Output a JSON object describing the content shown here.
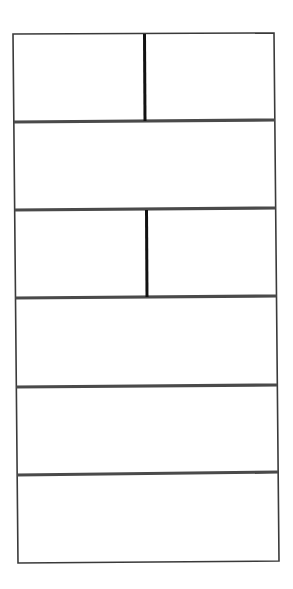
{
  "diagram": {
    "type": "panel-layout-grid",
    "colors": {
      "background": "#ffffff",
      "outer_border": "#3a3a3a",
      "row_divider": "#4a4a4a",
      "column_divider": "#111111"
    },
    "outer_box": {
      "top_left": [
        13,
        34
      ],
      "top_right": [
        274,
        33
      ],
      "bottom_right": [
        279,
        561
      ],
      "bottom_left": [
        18,
        563
      ]
    },
    "rows": [
      {
        "index": 1,
        "y_top": 34,
        "y_bottom": 121,
        "columns": 2,
        "split_x": 144
      },
      {
        "index": 2,
        "y_top": 121,
        "y_bottom": 209,
        "columns": 1
      },
      {
        "index": 3,
        "y_top": 209,
        "y_bottom": 297,
        "columns": 2,
        "split_x": 146
      },
      {
        "index": 4,
        "y_top": 297,
        "y_bottom": 386,
        "columns": 1
      },
      {
        "index": 5,
        "y_top": 386,
        "y_bottom": 474,
        "columns": 1
      },
      {
        "index": 6,
        "y_top": 474,
        "y_bottom": 562,
        "columns": 1
      }
    ],
    "row_dividers": [
      {
        "y_left": 122,
        "y_right": 120
      },
      {
        "y_left": 210,
        "y_right": 208
      },
      {
        "y_left": 298,
        "y_right": 296
      },
      {
        "y_left": 387,
        "y_right": 385
      },
      {
        "y_left": 475,
        "y_right": 472
      }
    ],
    "column_dividers": [
      {
        "x": 144.5,
        "y_top": 34,
        "y_bottom": 121
      },
      {
        "x": 146.5,
        "y_top": 210,
        "y_bottom": 297
      }
    ]
  }
}
